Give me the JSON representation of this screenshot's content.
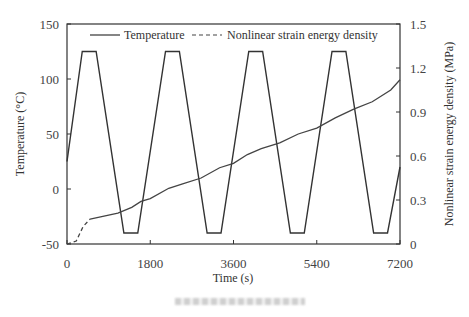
{
  "chart_data": {
    "type": "line",
    "title": "",
    "xlabel": "Time (s)",
    "ylabel": "Temperature (°C)",
    "y2label": "Nonlinear strain energy density (MPa)",
    "xlim": [
      0,
      7200
    ],
    "ylim": [
      -50,
      150
    ],
    "y2lim": [
      0,
      1.5
    ],
    "x_ticks": [
      "0",
      "1800",
      "3600",
      "5400",
      "7200"
    ],
    "y_ticks": [
      "150",
      "100",
      "50",
      "0",
      "-50"
    ],
    "y2_ticks": [
      "1.5",
      "1.2",
      "0.9",
      "0.6",
      "0.3",
      "0"
    ],
    "grid": false,
    "legend_position": "top inside",
    "series": [
      {
        "name": "Temperature",
        "style": "solid",
        "axis": "left",
        "x": [
          0,
          330,
          630,
          1230,
          1530,
          2130,
          2430,
          3030,
          3330,
          3930,
          4230,
          4830,
          5130,
          5730,
          6030,
          6630,
          6930,
          7200
        ],
        "values": [
          25,
          125,
          125,
          -40,
          -40,
          125,
          125,
          -40,
          -40,
          125,
          125,
          -40,
          -40,
          125,
          125,
          -40,
          -40,
          20
        ]
      },
      {
        "name": "Nonlinear strain energy density",
        "style": "dashed-then-solid",
        "axis": "right",
        "x": [
          0,
          200,
          350,
          500,
          800,
          1100,
          1400,
          1600,
          1800,
          2200,
          2500,
          2900,
          3300,
          3600,
          3900,
          4200,
          4600,
          5000,
          5400,
          5800,
          6200,
          6600,
          7000,
          7200
        ],
        "values": [
          0,
          0.02,
          0.12,
          0.17,
          0.19,
          0.21,
          0.25,
          0.29,
          0.31,
          0.38,
          0.41,
          0.45,
          0.52,
          0.55,
          0.61,
          0.65,
          0.69,
          0.75,
          0.79,
          0.86,
          0.92,
          0.97,
          1.05,
          1.12
        ]
      }
    ]
  },
  "legend": {
    "temperature_label": "Temperature",
    "strain_label": "Nonlinear strain energy density"
  },
  "axes": {
    "x_title": "Time (s)",
    "y_left_title": "Temperature (°C)",
    "y_right_title": "Nonlinear strain energy density (MPa)"
  },
  "colors": {
    "line": "#333333",
    "frame": "#333333",
    "text": "#444444"
  }
}
